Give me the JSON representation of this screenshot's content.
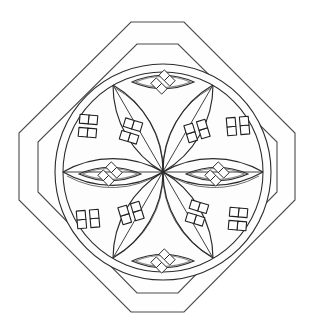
{
  "document": {
    "title": "Octagonal Rosette Mandala",
    "kind": "line-art-coloring-page",
    "background_color": "#ffffff",
    "ink_color": "#2b2b2b",
    "frame_ink_color": "#4a4a4a",
    "canvas": {
      "width": 315,
      "height": 334
    }
  },
  "frame": {
    "name": "double-octagon-border",
    "shape": "octagon",
    "rings": 2,
    "outer_octagon": {
      "label": "Outer octagon",
      "points": "131,22 184,22 295,133 295,200 184,312 131,312 19,200 19,133",
      "stroke": "#4a4a4a"
    },
    "inner_octagon": {
      "label": "Inner octagon",
      "points": "137,44 178,44 277,142 277,192 178,293 137,293 38,192 38,142",
      "stroke": "#4a4a4a"
    }
  },
  "rosette": {
    "name": "six-petal-rosette",
    "center": {
      "x": 163,
      "y": 172
    },
    "outer_circle": {
      "label": "Outer circle",
      "r": 108
    },
    "inner_circle": {
      "label": "Inner circle",
      "r": 100
    },
    "petal_count": 6,
    "petal_arc_radius": 100,
    "node_count": 6,
    "node_angles_deg": [
      0,
      60,
      120,
      180,
      240,
      300
    ],
    "nodes": [
      {
        "label": "node-east",
        "x": 263,
        "y": 172
      },
      {
        "label": "node-northeast",
        "x": 213,
        "y": 85
      },
      {
        "label": "node-northwest",
        "x": 113,
        "y": 85
      },
      {
        "label": "node-west",
        "x": 63,
        "y": 172
      },
      {
        "label": "node-southwest",
        "x": 113,
        "y": 258
      },
      {
        "label": "node-southeast",
        "x": 213,
        "y": 258
      }
    ]
  },
  "motifs": {
    "lens_flowers": {
      "label": "Lens quatrefoils",
      "count": 4,
      "description": "Four eye/lens shapes each containing a four-diamond floret",
      "items": [
        {
          "label": "lens-top",
          "cx": 163,
          "cy": 82,
          "rot": 0,
          "rx": 31,
          "ry": 13
        },
        {
          "label": "lens-bottom",
          "cx": 163,
          "cy": 261,
          "rot": 0,
          "rx": 31,
          "ry": 13
        },
        {
          "label": "lens-left",
          "cx": 110,
          "cy": 174,
          "rot": 0,
          "rx": 31,
          "ry": 13
        },
        {
          "label": "lens-right",
          "cx": 217,
          "cy": 174,
          "rot": 0,
          "rx": 31,
          "ry": 13
        }
      ]
    },
    "petal_flowers": {
      "label": "Petal quatrefoils",
      "count": 4,
      "description": "Four-diamond florets seated inside the rosette petals",
      "items": [
        {
          "label": "floret-petal-upper-left",
          "cx": 131,
          "cy": 131,
          "rot": -28,
          "size": 13
        },
        {
          "label": "floret-petal-upper-right",
          "cx": 197,
          "cy": 131,
          "rot": 28,
          "size": 13
        },
        {
          "label": "floret-petal-lower-left",
          "cx": 131,
          "cy": 213,
          "rot": 28,
          "size": 13
        },
        {
          "label": "floret-petal-lower-right",
          "cx": 197,
          "cy": 213,
          "rot": -28,
          "size": 13
        }
      ]
    },
    "corner_flowers": {
      "label": "Corner quatrefoils",
      "count": 4,
      "description": "Four-diamond florets in the outer lune regions near the circle rim",
      "items": [
        {
          "label": "floret-corner-upper-left",
          "cx": 88,
          "cy": 126,
          "rot": -40,
          "size": 13
        },
        {
          "label": "floret-corner-upper-right",
          "cx": 238,
          "cy": 126,
          "rot": 40,
          "size": 13
        },
        {
          "label": "floret-corner-lower-left",
          "cx": 88,
          "cy": 219,
          "rot": 40,
          "size": 13
        },
        {
          "label": "floret-corner-lower-right",
          "cx": 238,
          "cy": 219,
          "rot": -40,
          "size": 13
        }
      ]
    }
  },
  "legend": {
    "total_florets": 12,
    "symmetry": "6-fold rosette inside 8-fold frame"
  }
}
